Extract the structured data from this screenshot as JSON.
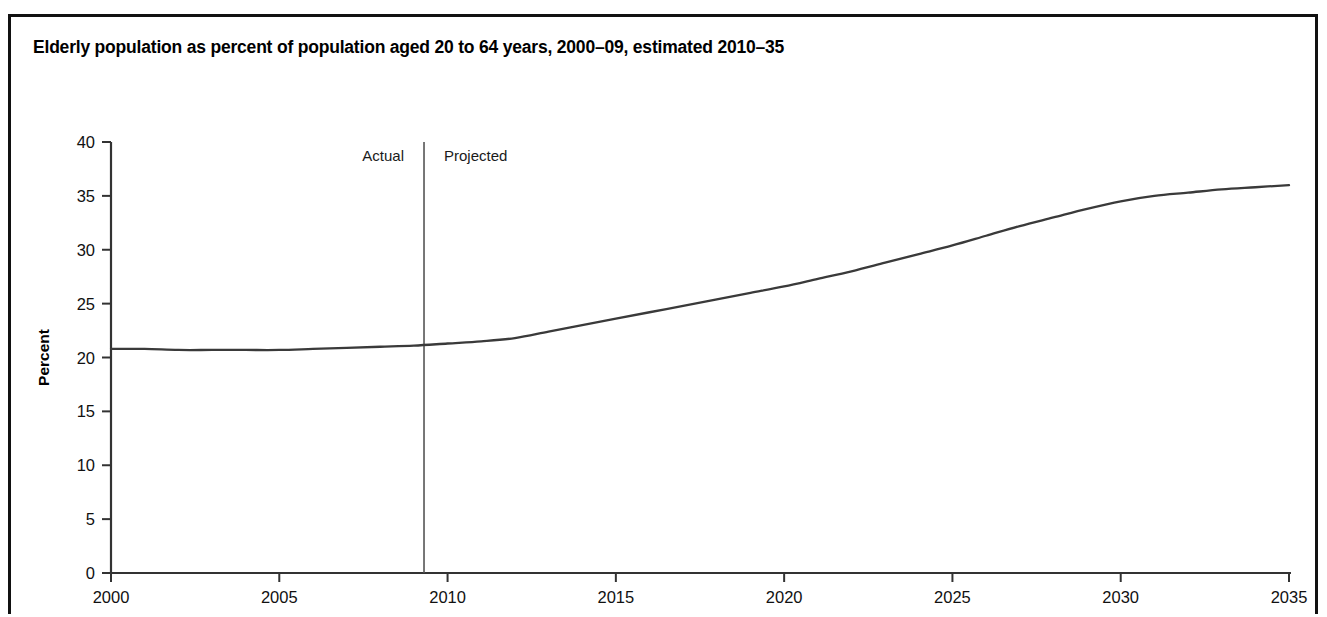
{
  "figure": {
    "title": "Elderly population as percent of population aged 20 to 64 years, 2000–09, estimated 2010–35",
    "border_color": "#111111",
    "background": "#ffffff"
  },
  "chart_data": {
    "type": "line",
    "title": "Elderly population as percent of population aged 20 to 64 years, 2000–09, estimated 2010–35",
    "xlabel": "",
    "ylabel": "Percent",
    "xlim": [
      2000,
      2035
    ],
    "ylim": [
      0,
      40
    ],
    "grid": false,
    "legend_position": "none",
    "line_color": "#3a3a3a",
    "x_ticks": [
      2000,
      2005,
      2010,
      2015,
      2020,
      2025,
      2030,
      2035
    ],
    "x_tick_labels": [
      "2000",
      "2005",
      "2010",
      "2015",
      "2020",
      "2025",
      "2030",
      "2035"
    ],
    "y_ticks": [
      0,
      5,
      10,
      15,
      20,
      25,
      30,
      35,
      40
    ],
    "y_tick_labels": [
      "0",
      "5",
      "10",
      "15",
      "20",
      "25",
      "30",
      "35",
      "40"
    ],
    "annotations": [
      {
        "text": "Actual",
        "x": 2009.3,
        "side": "left"
      },
      {
        "text": "Projected",
        "x": 2009.3,
        "side": "right"
      }
    ],
    "divider_x": 2009.3,
    "x": [
      2000,
      2001,
      2002,
      2003,
      2004,
      2005,
      2006,
      2007,
      2008,
      2009,
      2010,
      2011,
      2012,
      2013,
      2014,
      2015,
      2016,
      2017,
      2018,
      2019,
      2020,
      2021,
      2022,
      2023,
      2024,
      2025,
      2026,
      2027,
      2028,
      2029,
      2030,
      2031,
      2032,
      2033,
      2034,
      2035
    ],
    "values": [
      20.8,
      20.8,
      20.7,
      20.7,
      20.7,
      20.7,
      20.8,
      20.9,
      21.0,
      21.1,
      21.3,
      21.5,
      21.8,
      22.4,
      23.0,
      23.6,
      24.2,
      24.8,
      25.4,
      26.0,
      26.6,
      27.3,
      28.0,
      28.8,
      29.6,
      30.4,
      31.3,
      32.2,
      33.0,
      33.8,
      34.5,
      35.0,
      35.3,
      35.6,
      35.8,
      36.0
    ]
  },
  "plot_geometry": {
    "left": 100,
    "right": 1278,
    "top": 125,
    "bottom": 556
  }
}
